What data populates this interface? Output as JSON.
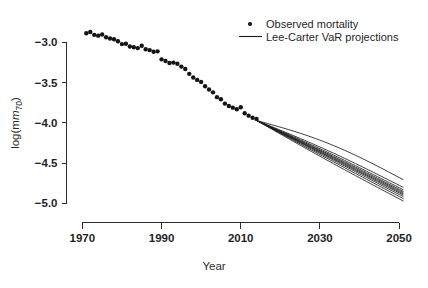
{
  "chart_data": {
    "type": "scatter",
    "title": "",
    "xlabel": "Year",
    "ylabel": "log(m70)",
    "ylabel_base": "log(m",
    "ylabel_sub": "70",
    "ylabel_close": ")",
    "xlim": [
      1966,
      2053
    ],
    "ylim": [
      -5.12,
      -2.82
    ],
    "grid": false,
    "xticks": [
      1970,
      1990,
      2010,
      2030,
      2050
    ],
    "xtick_labels": [
      "1970",
      "1990",
      "2010",
      "2030",
      "2050"
    ],
    "yticks": [
      -3.0,
      -3.5,
      -4.0,
      -4.5,
      -5.0
    ],
    "ytick_labels": [
      "-3.0",
      "-3.5",
      "-4.0",
      "-4.5",
      "-5.0"
    ],
    "legend": {
      "position": "top-right",
      "entries": [
        {
          "label": "Observed mortality",
          "marker": "point",
          "color": "#141414"
        },
        {
          "label": "Lee-Carter VaR projections",
          "marker": "line",
          "color": "#1a1a1a"
        }
      ]
    },
    "series": [
      {
        "name": "Observed mortality",
        "type": "scatter",
        "marker": "point",
        "color": "#141414",
        "x": [
          1971,
          1972,
          1973,
          1974,
          1975,
          1976,
          1977,
          1978,
          1979,
          1980,
          1981,
          1982,
          1983,
          1984,
          1985,
          1986,
          1987,
          1988,
          1989,
          1990,
          1991,
          1992,
          1993,
          1994,
          1995,
          1996,
          1997,
          1998,
          1999,
          2000,
          2001,
          2002,
          2003,
          2004,
          2005,
          2006,
          2007,
          2008,
          2009,
          2010,
          2011,
          2012,
          2013,
          2014
        ],
        "y": [
          -2.885,
          -2.87,
          -2.905,
          -2.915,
          -2.9,
          -2.935,
          -2.95,
          -2.96,
          -2.985,
          -3.02,
          -3.015,
          -3.05,
          -3.06,
          -3.07,
          -3.04,
          -3.085,
          -3.095,
          -3.115,
          -3.11,
          -3.21,
          -3.23,
          -3.255,
          -3.25,
          -3.265,
          -3.3,
          -3.33,
          -3.39,
          -3.435,
          -3.465,
          -3.49,
          -3.545,
          -3.585,
          -3.62,
          -3.68,
          -3.705,
          -3.76,
          -3.79,
          -3.81,
          -3.83,
          -3.805,
          -3.88,
          -3.91,
          -3.935,
          -3.95
        ]
      },
      {
        "name": "Lee-Carter VaR projections",
        "type": "line",
        "color": "#1a1a1a",
        "start_year": 2014,
        "end_year": 2051,
        "start_value": -3.97,
        "end_values": [
          -4.705,
          -4.8,
          -4.83,
          -4.85,
          -4.865,
          -4.88,
          -4.895,
          -4.915,
          -4.94,
          -4.97
        ],
        "curvatures": [
          0.075,
          0.03,
          0.022,
          0.016,
          0.012,
          0.008,
          0.005,
          0.002,
          -0.004,
          -0.012
        ]
      }
    ]
  }
}
